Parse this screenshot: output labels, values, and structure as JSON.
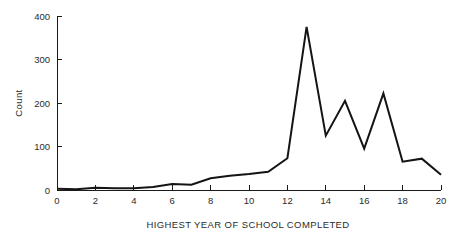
{
  "chart_data": {
    "type": "line",
    "title": "",
    "subtitle": "",
    "xlabel": "HIGHEST YEAR OF SCHOOL COMPLETED",
    "ylabel": "Count",
    "xlim": [
      0,
      20
    ],
    "ylim": [
      0,
      400
    ],
    "xticks": [
      0,
      2,
      4,
      6,
      8,
      10,
      12,
      14,
      16,
      18,
      20
    ],
    "xtick_labels": [
      "0",
      "2",
      "4",
      "6",
      "8",
      "10",
      "12",
      "14",
      "16",
      "18",
      "20"
    ],
    "yticks": [
      0,
      100,
      200,
      300,
      400
    ],
    "ytick_labels": [
      "0",
      "100",
      "200",
      "300",
      "400"
    ],
    "grid": false,
    "legend": false,
    "legend_position": "none",
    "line_color": "#141414",
    "x": [
      0,
      1,
      2,
      3,
      4,
      5,
      6,
      7,
      8,
      9,
      10,
      11,
      12,
      13,
      14,
      15,
      16,
      17,
      18,
      19,
      20
    ],
    "values": [
      3,
      2,
      5,
      4,
      4,
      7,
      14,
      12,
      27,
      33,
      37,
      42,
      73,
      375,
      125,
      205,
      95,
      222,
      65,
      72,
      35
    ],
    "series": [
      {
        "name": "Count",
        "x": [
          0,
          1,
          2,
          3,
          4,
          5,
          6,
          7,
          8,
          9,
          10,
          11,
          12,
          13,
          14,
          15,
          16,
          17,
          18,
          19,
          20
        ],
        "values": [
          3,
          2,
          5,
          4,
          4,
          7,
          14,
          12,
          27,
          33,
          37,
          42,
          73,
          375,
          125,
          205,
          95,
          222,
          65,
          72,
          35
        ]
      }
    ]
  }
}
